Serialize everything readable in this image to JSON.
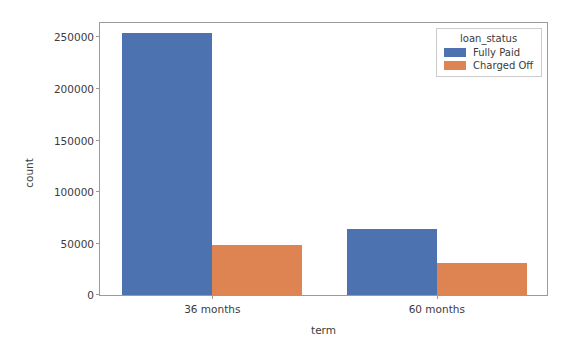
{
  "chart_data": {
    "type": "bar",
    "title": "",
    "xlabel": "term",
    "ylabel": "count",
    "categories": [
      "36 months",
      "60 months"
    ],
    "series": [
      {
        "name": "Fully Paid",
        "color": "#4C72B0",
        "values": [
          254000,
          64200
        ]
      },
      {
        "name": "Charged Off",
        "color": "#DD8452",
        "values": [
          48500,
          31100
        ]
      }
    ],
    "ylim": [
      0,
      266000
    ],
    "yticks": [
      0,
      50000,
      100000,
      150000,
      200000,
      250000
    ],
    "ytick_labels": [
      "0",
      "50000",
      "100000",
      "150000",
      "200000",
      "250000"
    ],
    "grid": false,
    "legend": {
      "title": "loan_status",
      "position": "upper right",
      "entries": [
        {
          "label": "Fully Paid",
          "color": "#4C72B0"
        },
        {
          "label": "Charged Off",
          "color": "#DD8452"
        }
      ]
    }
  }
}
